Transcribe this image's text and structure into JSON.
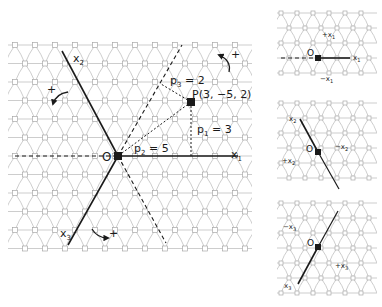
{
  "diagram": {
    "main": {
      "origin_label": "O",
      "point_label": "P(3, −5, 2)",
      "point": {
        "p1": 3,
        "p2": -5,
        "p3": 2
      },
      "axes": [
        {
          "name": "x",
          "sub": "1"
        },
        {
          "name": "x",
          "sub": "2"
        },
        {
          "name": "x",
          "sub": "3"
        }
      ],
      "projections": [
        {
          "p": "p",
          "sub": "1",
          "eq": " = 3"
        },
        {
          "p": "p",
          "sub": "2",
          "eq": " = 5"
        },
        {
          "p": "p",
          "sub": "3",
          "eq": " = 2"
        }
      ],
      "rotation_sign": "+"
    },
    "panels": [
      {
        "axis": {
          "name": "x",
          "sub": "1"
        },
        "origin_label": "O",
        "plus_label": "+x",
        "plus_sub": "1",
        "minus_label": "−x",
        "minus_sub": "1"
      },
      {
        "axis": {
          "name": "x",
          "sub": "2"
        },
        "origin_label": "O",
        "plus_label": "+x",
        "plus_sub": "2",
        "minus_label": "−x",
        "minus_sub": "2"
      },
      {
        "axis": {
          "name": "x",
          "sub": "3"
        },
        "origin_label": "O",
        "plus_label": "+x",
        "plus_sub": "3",
        "minus_label": "−x",
        "minus_sub": "3"
      }
    ],
    "colors": {
      "ink": "#1a1a1a",
      "lattice_line": "#b8b8b8",
      "lattice_node": "#a8a8a8"
    }
  }
}
